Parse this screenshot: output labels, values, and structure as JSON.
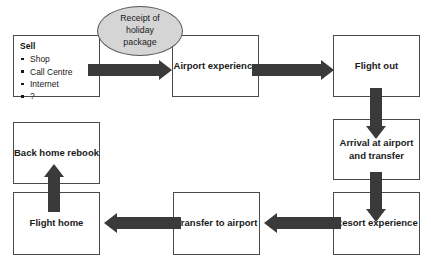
{
  "diagram": {
    "colors": {
      "arrow": "#3a3a3a",
      "ellipse_fill": "#d5d5d5",
      "box_border": "#4a4a4a",
      "background": "#ffffff",
      "text": "#1a1a1a"
    },
    "sell_node": {
      "title": "Sell",
      "items": [
        {
          "label": "Shop"
        },
        {
          "label": "Call Centre"
        },
        {
          "label": "Internet"
        },
        {
          "label": "?"
        }
      ]
    },
    "ellipse_node": {
      "label": "Receipt of holiday package",
      "line1": "Receipt of",
      "line2": "holiday",
      "line3": "package"
    },
    "nodes": [
      {
        "id": "airport-experience",
        "label": "Airport experience"
      },
      {
        "id": "flight-out",
        "label": "Flight out"
      },
      {
        "id": "arrival-at-airport-and-transfer",
        "label": "Arrival at airport and transfer"
      },
      {
        "id": "resort-experience",
        "label": "Resort experience"
      },
      {
        "id": "transfer-to-airport",
        "label": "Transfer to airport"
      },
      {
        "id": "flight-home",
        "label": "Flight home"
      },
      {
        "id": "back-home-rebook",
        "label": "Back home rebook"
      }
    ],
    "connectors": [
      {
        "id": "sell-to-airport",
        "direction": "right"
      },
      {
        "id": "airport-to-flight-out",
        "direction": "right"
      },
      {
        "id": "flight-out-to-arrival",
        "direction": "down"
      },
      {
        "id": "arrival-to-resort",
        "direction": "down"
      },
      {
        "id": "resort-to-transfer",
        "direction": "left"
      },
      {
        "id": "transfer-to-flight-home",
        "direction": "left"
      },
      {
        "id": "flight-home-to-back-home",
        "direction": "up"
      }
    ]
  }
}
